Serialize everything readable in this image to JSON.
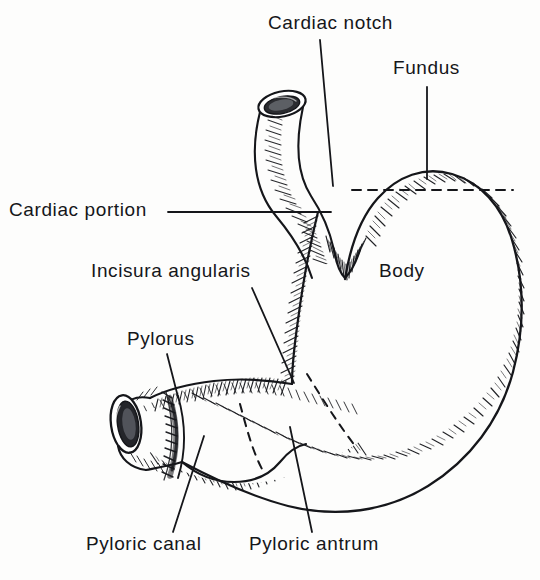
{
  "figure": {
    "kind": "anatomical-illustration",
    "background_color": "#fdfdfc",
    "ink_color": "#15161a",
    "width": 540,
    "height": 580
  },
  "labels": {
    "cardiac_notch": "Cardiac notch",
    "fundus": "Fundus",
    "cardiac_portion": "Cardiac portion",
    "incisura_angularis": "Incisura angularis",
    "body": "Body",
    "pylorus": "Pylorus",
    "pyloric_canal": "Pyloric canal",
    "pyloric_antrum": "Pyloric antrum"
  },
  "annotations": [
    {
      "id": "cardiac-notch",
      "text": "Cardiac notch",
      "label_x": 268,
      "label_y": 13,
      "leader": {
        "x1": 320,
        "y1": 40,
        "x2": 333,
        "y2": 186
      }
    },
    {
      "id": "fundus",
      "text": "Fundus",
      "label_x": 393,
      "label_y": 58,
      "leader": {
        "x1": 427,
        "y1": 87,
        "x2": 427,
        "y2": 179
      }
    },
    {
      "id": "cardiac-portion",
      "text": "Cardiac portion",
      "label_x": 9,
      "label_y": 200,
      "leader": {
        "x1": 168,
        "y1": 212,
        "x2": 331,
        "y2": 212
      }
    },
    {
      "id": "incisura-angularis",
      "text": "Incisura angularis",
      "label_x": 91,
      "label_y": 261,
      "leader": {
        "x1": 252,
        "y1": 288,
        "x2": 294,
        "y2": 383
      }
    },
    {
      "id": "body",
      "text": "Body",
      "label_x": 379,
      "label_y": 261,
      "leader": null
    },
    {
      "id": "pylorus",
      "text": "Pylorus",
      "label_x": 127,
      "label_y": 329,
      "leader": {
        "x1": 167,
        "y1": 354,
        "x2": 178,
        "y2": 397
      }
    },
    {
      "id": "pyloric-canal",
      "text": "Pyloric canal",
      "label_x": 86,
      "label_y": 534,
      "leader": {
        "x1": 204,
        "y1": 436,
        "x2": 173,
        "y2": 532
      }
    },
    {
      "id": "pyloric-antrum",
      "text": "Pyloric antrum",
      "label_x": 249,
      "label_y": 534,
      "leader": {
        "x1": 290,
        "y1": 427,
        "x2": 312,
        "y2": 532
      }
    }
  ],
  "structures": [
    {
      "id": "esophagus",
      "name": "esophagus-tube"
    },
    {
      "id": "esophagus-lumen",
      "name": "esophagus-opening"
    },
    {
      "id": "fundus-dome",
      "name": "fundus-dome"
    },
    {
      "id": "greater-curvature",
      "name": "greater-curvature"
    },
    {
      "id": "lesser-curvature",
      "name": "lesser-curvature"
    },
    {
      "id": "body-chamber",
      "name": "stomach-body"
    },
    {
      "id": "pyloric-antrum",
      "name": "pyloric-antrum"
    },
    {
      "id": "pyloric-canal",
      "name": "pyloric-canal"
    },
    {
      "id": "pylorus-ring",
      "name": "pylorus-opening"
    }
  ],
  "guides": {
    "fundus_boundary_dashed": {
      "x1": 352,
      "y1": 190,
      "x2": 513,
      "y2": 190,
      "dash": "9 7"
    },
    "antrum_boundary_dashed": {
      "from": [
        307,
        374
      ],
      "to": [
        356,
        447
      ],
      "dash": "8 7"
    },
    "canal_boundary_dashed": {
      "from": [
        240,
        404
      ],
      "to": [
        262,
        469
      ],
      "dash": "8 7"
    }
  }
}
